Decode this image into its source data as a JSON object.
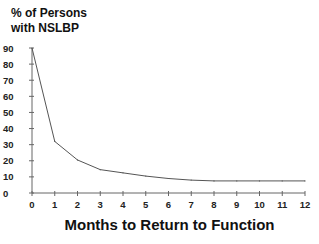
{
  "chart_data": {
    "type": "line",
    "title": "",
    "ylabel": "% of Persons\nwith NSLBP",
    "xlabel": "Months to Return to Function",
    "x": [
      0,
      1,
      2,
      3,
      4,
      5,
      6,
      7,
      8,
      9,
      10,
      11,
      12
    ],
    "series": [
      {
        "name": "% of Persons with NSLBP",
        "values": [
          90,
          32,
          20.5,
          14.5,
          12.5,
          10.5,
          9,
          8,
          7.5,
          7.5,
          7.5,
          7.5,
          7.5
        ]
      }
    ],
    "xticks": [
      "0",
      "1",
      "2",
      "3",
      "4",
      "5",
      "6",
      "7",
      "8",
      "9",
      "10",
      "11",
      "12"
    ],
    "yticks": [
      "0",
      "10",
      "20",
      "30",
      "40",
      "50",
      "60",
      "70",
      "80",
      "90"
    ],
    "xlim": [
      0,
      12
    ],
    "ylim": [
      0,
      90
    ],
    "grid": false,
    "legend": "none",
    "line_color": "#555555"
  }
}
